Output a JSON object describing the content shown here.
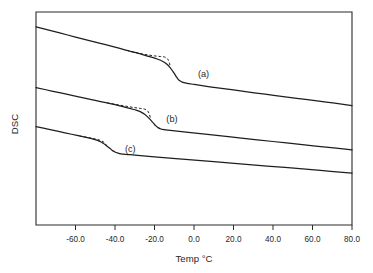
{
  "chart_data": {
    "type": "line",
    "title": "",
    "xlabel": "Temp °C",
    "ylabel": "DSC",
    "xlim": [
      -80,
      80
    ],
    "ylim": [
      0,
      1
    ],
    "grid": false,
    "legend": "none",
    "xticks": [
      -60.0,
      -40.0,
      -20.0,
      0.0,
      20.0,
      40.0,
      60.0,
      80.0
    ],
    "xtick_labels": [
      "-60.0",
      "-40.0",
      "-20.0",
      "0.0",
      "20.0",
      "40.0",
      "60.0",
      "80.0"
    ],
    "yticks": [],
    "ytick_labels": [],
    "annotations": [
      {
        "text": "(a)",
        "x": 2.0,
        "y": 0.695
      },
      {
        "text": "(b)",
        "x": -14.0,
        "y": 0.482
      },
      {
        "text": "(c)",
        "x": -35.0,
        "y": 0.345
      }
    ],
    "series": [
      {
        "name": "(a)",
        "style": "solid",
        "glass_transition_C": -12.0,
        "x": [
          -80,
          -72,
          -64,
          -56,
          -48,
          -40,
          -34,
          -30,
          -26,
          -22,
          -18,
          -16,
          -14,
          -12,
          -10,
          -9,
          -8,
          -7,
          -6,
          -4,
          0,
          8,
          20,
          36,
          52,
          68,
          80
        ],
        "y": [
          0.93,
          0.911,
          0.892,
          0.873,
          0.854,
          0.835,
          0.82,
          0.81,
          0.8,
          0.789,
          0.777,
          0.769,
          0.757,
          0.738,
          0.712,
          0.697,
          0.684,
          0.676,
          0.671,
          0.666,
          0.66,
          0.649,
          0.634,
          0.614,
          0.595,
          0.576,
          0.561
        ]
      },
      {
        "name": "(a)-overshoot",
        "style": "dashed",
        "x": [
          -34,
          -30,
          -26,
          -23,
          -20,
          -17,
          -15,
          -13.5,
          -12.5,
          -12
        ],
        "y": [
          0.82,
          0.811,
          0.803,
          0.798,
          0.794,
          0.791,
          0.789,
          0.781,
          0.762,
          0.74
        ]
      },
      {
        "name": "(b)",
        "style": "solid",
        "glass_transition_C": -22.0,
        "x": [
          -80,
          -72,
          -64,
          -56,
          -50,
          -44,
          -40,
          -36,
          -32,
          -29,
          -27,
          -25,
          -23,
          -21,
          -20,
          -19,
          -18,
          -17,
          -16,
          -12,
          -4,
          8,
          24,
          40,
          56,
          72,
          80
        ],
        "y": [
          0.645,
          0.629,
          0.613,
          0.597,
          0.585,
          0.573,
          0.565,
          0.556,
          0.546,
          0.538,
          0.531,
          0.52,
          0.503,
          0.483,
          0.472,
          0.463,
          0.456,
          0.452,
          0.449,
          0.444,
          0.436,
          0.424,
          0.408,
          0.392,
          0.376,
          0.361,
          0.353
        ]
      },
      {
        "name": "(b)-overshoot",
        "style": "dashed",
        "x": [
          -44,
          -39,
          -34,
          -30,
          -27,
          -25,
          -23.5,
          -22.5,
          -22
        ],
        "y": [
          0.573,
          0.565,
          0.557,
          0.551,
          0.547,
          0.544,
          0.536,
          0.518,
          0.498
        ]
      },
      {
        "name": "(c)",
        "style": "solid",
        "glass_transition_C": -44.0,
        "x": [
          -80,
          -74,
          -68,
          -62,
          -58,
          -54,
          -51,
          -48,
          -46,
          -44,
          -42,
          -41,
          -40,
          -39,
          -38,
          -36,
          -30,
          -20,
          -6,
          10,
          28,
          46,
          64,
          80
        ],
        "y": [
          0.462,
          0.45,
          0.438,
          0.426,
          0.418,
          0.41,
          0.403,
          0.394,
          0.384,
          0.37,
          0.355,
          0.348,
          0.343,
          0.339,
          0.336,
          0.333,
          0.328,
          0.32,
          0.309,
          0.297,
          0.283,
          0.27,
          0.256,
          0.243
        ]
      },
      {
        "name": "(c)-overshoot",
        "style": "dashed",
        "x": [
          -58,
          -54,
          -51,
          -48,
          -46,
          -45,
          -44.2
        ],
        "y": [
          0.418,
          0.411,
          0.406,
          0.399,
          0.391,
          0.383,
          0.372
        ]
      }
    ]
  }
}
